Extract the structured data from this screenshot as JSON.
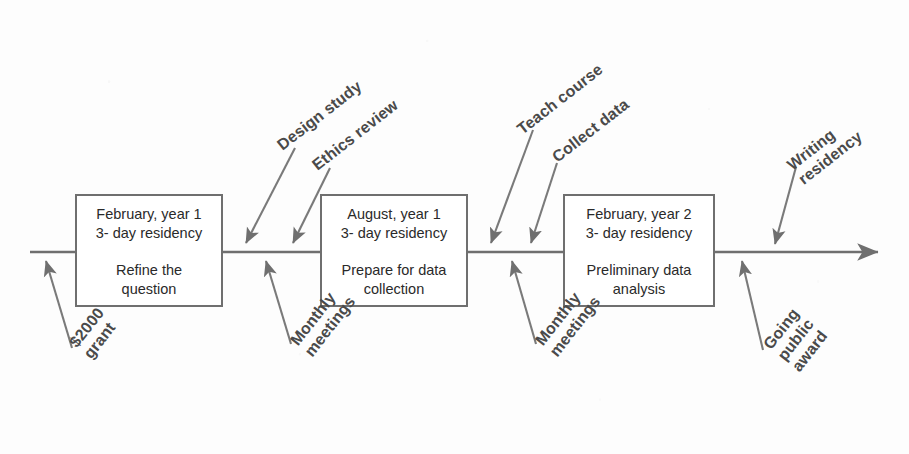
{
  "diagram": {
    "type": "timeline",
    "axis": {
      "label": "",
      "direction": "left-to-right",
      "arrowhead": "right"
    },
    "colors": {
      "line": "#6f6f6f",
      "box_border": "#6f6f6f",
      "box_fill": "#ffffff",
      "text": "#2a2a2a",
      "annotation_text": "#4a4a4a",
      "background": "#fdfdfd"
    }
  },
  "milestones": [
    {
      "id": "milestone-1",
      "when": "February, year 1\n3- day residency",
      "what": "Refine the\nquestion"
    },
    {
      "id": "milestone-2",
      "when": "August, year 1\n3- day residency",
      "what": "Prepare for data\ncollection"
    },
    {
      "id": "milestone-3",
      "when": "February, year 2\n3- day residency",
      "what": "Preliminary data\nanalysis"
    }
  ],
  "annotations_above": [
    {
      "id": "design-study",
      "text": "Design study"
    },
    {
      "id": "ethics-review",
      "text": "Ethics review"
    },
    {
      "id": "teach-course",
      "text": "Teach course"
    },
    {
      "id": "collect-data",
      "text": "Collect data"
    },
    {
      "id": "writing-residency",
      "text": "Writing\nresidency"
    }
  ],
  "annotations_below": [
    {
      "id": "grant",
      "text": "$2000\ngrant"
    },
    {
      "id": "monthly-meetings-1",
      "text": "Monthly\nmeetings"
    },
    {
      "id": "monthly-meetings-2",
      "text": "Monthly\nmeetings"
    },
    {
      "id": "going-public-award",
      "text": "Going\npublic\naward"
    }
  ]
}
